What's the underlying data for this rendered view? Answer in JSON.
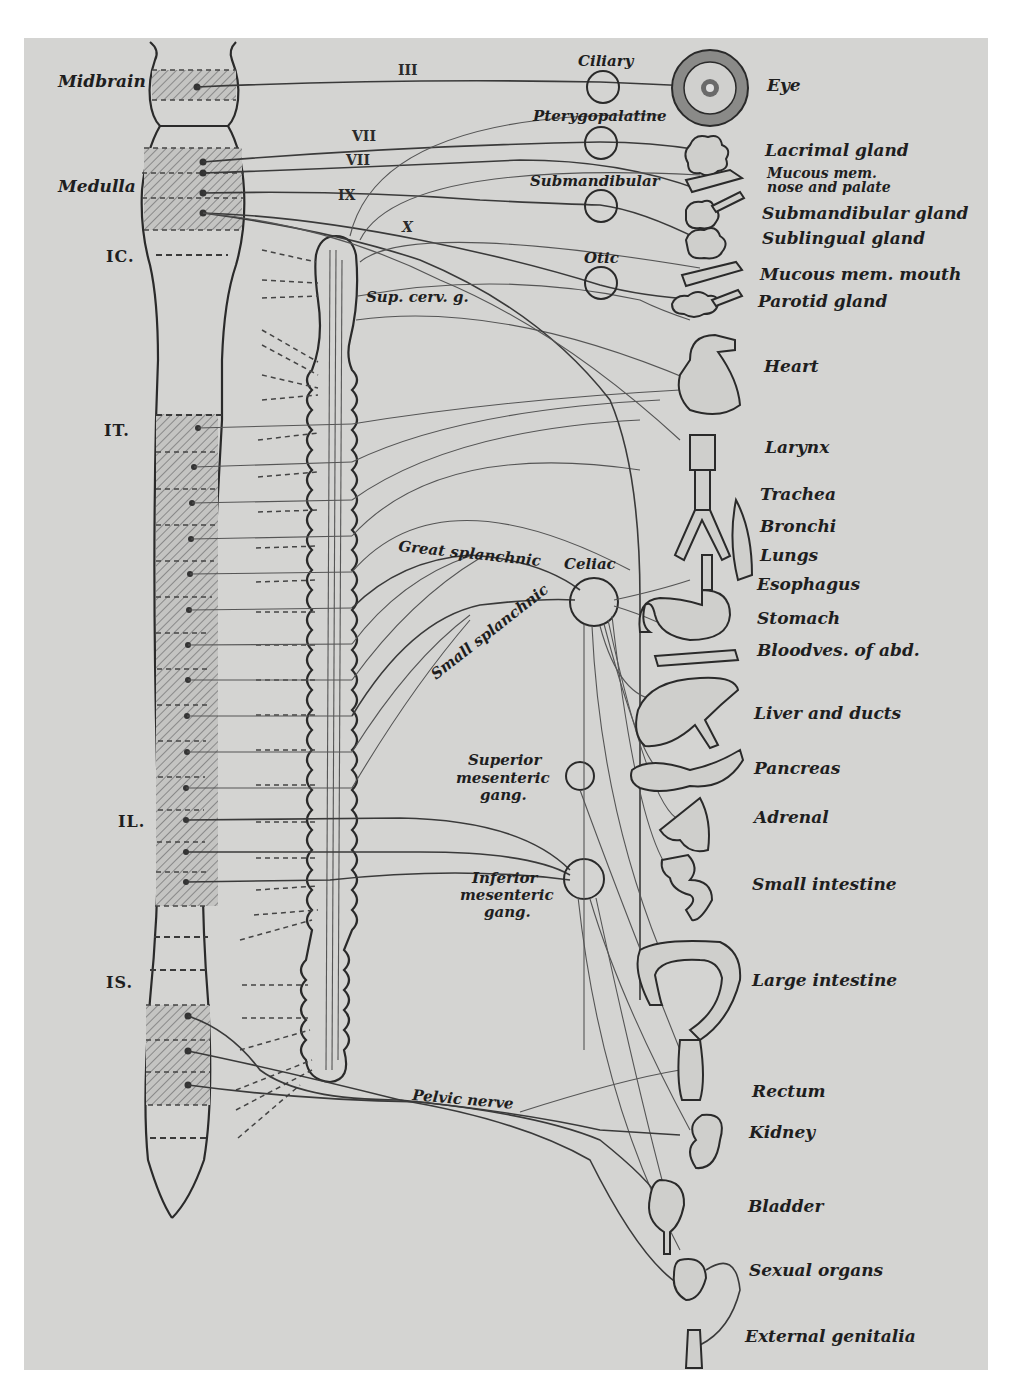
{
  "figure": {
    "background_color": "#d4d4d2",
    "ink_color": "#2a2a2a"
  },
  "cns": {
    "regions": [
      {
        "id": "midbrain",
        "label": "Midbrain"
      },
      {
        "id": "medulla",
        "label": "Medulla"
      }
    ],
    "levels": [
      {
        "id": "c1",
        "label": "IC."
      },
      {
        "id": "t1",
        "label": "IT."
      },
      {
        "id": "l1",
        "label": "IL."
      },
      {
        "id": "s1",
        "label": "IS."
      }
    ]
  },
  "cranial_nerves": [
    {
      "id": "n3",
      "label": "III"
    },
    {
      "id": "n7a",
      "label": "VII"
    },
    {
      "id": "n7b",
      "label": "VII"
    },
    {
      "id": "n9",
      "label": "IX"
    },
    {
      "id": "n10",
      "label": "X"
    }
  ],
  "ganglia": {
    "ciliary": "Ciliary",
    "pterygopalatine": "Pterygopalatine",
    "submandibular": "Submandibular",
    "otic": "Otic",
    "sup_cerv": "Sup. cerv. g.",
    "celiac": "Celiac",
    "sup_mesenteric": [
      "Superior",
      "mesenteric",
      "gang."
    ],
    "inf_mesenteric": [
      "Inferior",
      "mesenteric",
      "gang."
    ]
  },
  "nerves": {
    "great_splanchnic": "Great splanchnic",
    "small_splanchnic": "Small splanchnic",
    "pelvic": "Pelvic nerve"
  },
  "organs": [
    {
      "id": "eye",
      "label": "Eye"
    },
    {
      "id": "lacrimal",
      "label": "Lacrimal gland"
    },
    {
      "id": "mucous_nose",
      "label": [
        "Mucous mem.",
        "nose and palate"
      ]
    },
    {
      "id": "submandibular_gland",
      "label": "Submandibular gland"
    },
    {
      "id": "sublingual",
      "label": "Sublingual gland"
    },
    {
      "id": "mucous_mouth",
      "label": "Mucous mem. mouth"
    },
    {
      "id": "parotid",
      "label": "Parotid gland"
    },
    {
      "id": "heart",
      "label": "Heart"
    },
    {
      "id": "larynx",
      "label": "Larynx"
    },
    {
      "id": "trachea",
      "label": "Trachea"
    },
    {
      "id": "bronchi",
      "label": "Bronchi"
    },
    {
      "id": "lungs",
      "label": "Lungs"
    },
    {
      "id": "esophagus",
      "label": "Esophagus"
    },
    {
      "id": "stomach",
      "label": "Stomach"
    },
    {
      "id": "bloodves",
      "label": "Bloodves. of abd."
    },
    {
      "id": "liver",
      "label": "Liver and ducts"
    },
    {
      "id": "pancreas",
      "label": "Pancreas"
    },
    {
      "id": "adrenal",
      "label": "Adrenal"
    },
    {
      "id": "small_intestine",
      "label": "Small intestine"
    },
    {
      "id": "large_intestine",
      "label": "Large intestine"
    },
    {
      "id": "rectum",
      "label": "Rectum"
    },
    {
      "id": "kidney",
      "label": "Kidney"
    },
    {
      "id": "bladder",
      "label": "Bladder"
    },
    {
      "id": "sexual_organs",
      "label": "Sexual organs"
    },
    {
      "id": "external_genitalia",
      "label": "External genitalia"
    }
  ]
}
